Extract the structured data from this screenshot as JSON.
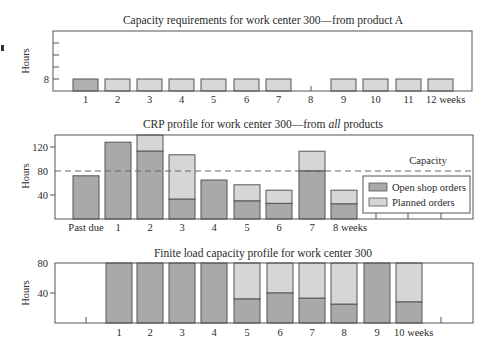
{
  "colors": {
    "open_shop": "#a9a9a9",
    "planned": "#d6d6d6",
    "product_a_first": "#b0b0b0",
    "product_a_other": "#d8d8d8",
    "frame": "#555555",
    "bar_stroke": "#555555",
    "capacity_line": "#666666"
  },
  "chart_data": [
    {
      "type": "bar",
      "title": "Capacity requirements for work center 300—from product A",
      "xlabel": "weeks",
      "ylabel": "Hours",
      "categories": [
        "1",
        "2",
        "3",
        "4",
        "5",
        "6",
        "7",
        "8",
        "9",
        "10",
        "11",
        "12 weeks"
      ],
      "values": [
        8,
        8,
        8,
        8,
        8,
        8,
        8,
        0,
        8,
        8,
        8,
        8
      ],
      "yticks": [
        8
      ],
      "ylim": [
        0,
        40
      ],
      "grid": false,
      "note": "Week 1 bar darker (open shop order); weeks 2-7 and 9-12 lighter (planned); week 8 has no requirement"
    },
    {
      "type": "bar",
      "stacked": true,
      "title": "CRP profile for work center 300—from all products",
      "xlabel": "weeks",
      "ylabel": "Hours",
      "categories": [
        "Past due",
        "1",
        "2",
        "3",
        "4",
        "5",
        "6",
        "7",
        "8 weeks"
      ],
      "series": [
        {
          "name": "Open shop orders",
          "values": [
            72,
            128,
            113,
            33,
            65,
            30,
            26,
            80,
            25
          ]
        },
        {
          "name": "Planned orders",
          "values": [
            0,
            0,
            27,
            74,
            0,
            27,
            22,
            33,
            23
          ]
        }
      ],
      "capacity": 80,
      "capacity_label": "Capacity",
      "yticks": [
        40,
        80,
        120
      ],
      "ylim": [
        0,
        140
      ],
      "legend_position": "lower right",
      "grid": false
    },
    {
      "type": "bar",
      "stacked": true,
      "title": "Finite load capacity profile for work center 300",
      "xlabel": "weeks",
      "ylabel": "Hours",
      "categories": [
        "1",
        "2",
        "3",
        "4",
        "5",
        "6",
        "7",
        "8",
        "9",
        "10 weeks"
      ],
      "series": [
        {
          "name": "Open shop orders",
          "values": [
            80,
            80,
            80,
            80,
            32,
            40,
            33,
            25,
            80,
            28
          ]
        },
        {
          "name": "Planned orders",
          "values": [
            0,
            0,
            0,
            0,
            48,
            40,
            47,
            55,
            0,
            52
          ]
        }
      ],
      "yticks": [
        40,
        80
      ],
      "ylim": [
        0,
        80
      ],
      "grid": false
    }
  ],
  "charts": {
    "top": {
      "title": "Capacity requirements for work center 300—from product A",
      "ylabel": "Hours",
      "ytick": "8",
      "xlabels": [
        "1",
        "2",
        "3",
        "4",
        "5",
        "6",
        "7",
        "8",
        "9",
        "10",
        "11",
        "12 weeks"
      ]
    },
    "middle": {
      "title_prefix": "CRP profile for work center 300—from ",
      "title_italic": "all",
      "title_suffix": " products",
      "ylabel": "Hours",
      "yticks": [
        "120",
        "80",
        "40"
      ],
      "xlabels": [
        "Past due",
        "1",
        "2",
        "3",
        "4",
        "5",
        "6",
        "7",
        "8 weeks"
      ],
      "capacity_label": "Capacity",
      "legend": {
        "open_shop": "Open shop orders",
        "planned": "Planned orders"
      }
    },
    "bottom": {
      "title": "Finite load capacity profile for work center 300",
      "ylabel": "Hours",
      "yticks": [
        "80",
        "40"
      ],
      "xlabels": [
        "1",
        "2",
        "3",
        "4",
        "5",
        "6",
        "7",
        "8",
        "9",
        "10 weeks"
      ]
    }
  }
}
